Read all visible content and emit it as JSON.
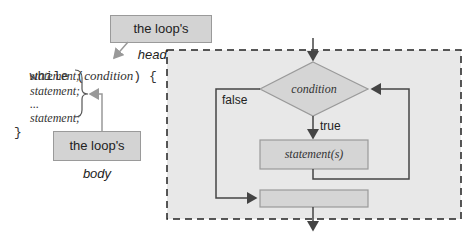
{
  "code": {
    "while_keyword": "while",
    "open_paren": "(",
    "condition": "condition",
    "close_paren_brace": ") {",
    "statements": [
      "statement;",
      "statement;",
      "...",
      "statement;"
    ],
    "closing_brace": "}"
  },
  "callouts": {
    "heading": {
      "prefix": "the loop's ",
      "emph": "heading"
    },
    "body": {
      "prefix": "the loop's ",
      "emph": "body"
    }
  },
  "flowchart": {
    "condition_label": "condition",
    "true_label": "true",
    "false_label": "false",
    "statement_label": "statement(s)"
  },
  "colors": {
    "panel_bg": "#e8e8e8",
    "shape_fill": "#d5d5d5",
    "shape_stroke": "#9a9a9a",
    "line": "#444444"
  }
}
